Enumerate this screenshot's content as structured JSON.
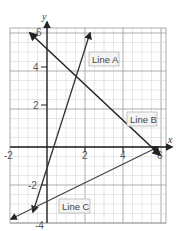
{
  "chart_data": {
    "type": "line",
    "title": "",
    "xlabel": "x",
    "ylabel": "y",
    "xlim": [
      -2,
      6
    ],
    "ylim": [
      -4,
      6
    ],
    "grid": true,
    "minor_grid_step": 0.5,
    "major_grid_step": 2,
    "x_ticks": [
      -2,
      2,
      4,
      6
    ],
    "y_ticks": [
      6,
      4,
      2,
      -2,
      -4
    ],
    "x_tick_labels": [
      "-2",
      "2",
      "4",
      "6"
    ],
    "y_tick_labels": [
      "6",
      "4",
      "2",
      "-2",
      "-4"
    ],
    "series": [
      {
        "name": "Line A",
        "equation_estimate": "y = 3x - 1.2",
        "points": [
          [
            -0.75,
            -3.4
          ],
          [
            2.25,
            6.0
          ]
        ],
        "arrows": "both"
      },
      {
        "name": "Line B",
        "equation_estimate": "y = -x + 5.3",
        "points": [
          [
            -0.9,
            6.0
          ],
          [
            5.95,
            -0.4
          ]
        ],
        "arrows": "both"
      },
      {
        "name": "Line C",
        "equation_estimate": "y = 0.5x - 2.9",
        "points": [
          [
            -1.9,
            -3.8
          ],
          [
            5.9,
            -0.05
          ]
        ],
        "arrows": "both"
      }
    ],
    "labels": [
      {
        "text": "Line A",
        "near": [
          2.5,
          4.3
        ]
      },
      {
        "text": "Line B",
        "near": [
          5.2,
          1.2
        ]
      },
      {
        "text": "Line C",
        "near": [
          1.2,
          -3.3
        ]
      }
    ]
  },
  "axes": {
    "x_name": "x",
    "y_name": "y"
  },
  "ticks": {
    "x": [
      "-2",
      "2",
      "4",
      "6"
    ],
    "y": [
      "6",
      "4",
      "2",
      "-2",
      "-4"
    ]
  },
  "legend_labels": {
    "line_a": "Line A",
    "line_b": "Line B",
    "line_c": "Line C"
  },
  "colors": {
    "grid_minor": "#cfcfcf",
    "grid_major": "#9a9a9a",
    "axis": "#222222",
    "line": "#2a2a2a",
    "label_border": "#b8b8b8",
    "label_bg": "#f4f4f4"
  }
}
